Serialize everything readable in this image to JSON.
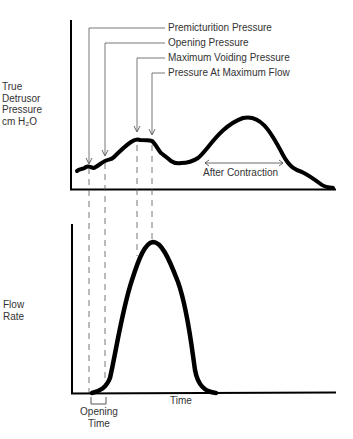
{
  "diagram": {
    "top_chart": {
      "y_label_lines": [
        "True",
        "Detrusor",
        "Pressure",
        "cm H₂O"
      ],
      "annotations": [
        {
          "label": "Premicturition Pressure"
        },
        {
          "label": "Opening Pressure"
        },
        {
          "label": "Maximum Voiding Pressure"
        },
        {
          "label": "Pressure At Maximum Flow"
        }
      ],
      "after_contraction_label": "After Contraction"
    },
    "bottom_chart": {
      "y_label_lines": [
        "Flow",
        "Rate"
      ],
      "x_label": "Time",
      "opening_time_lines": [
        "Opening",
        "Time"
      ]
    },
    "colors": {
      "curve": "#000000",
      "guide": "#555555",
      "text": "#333333",
      "background": "#ffffff"
    }
  }
}
